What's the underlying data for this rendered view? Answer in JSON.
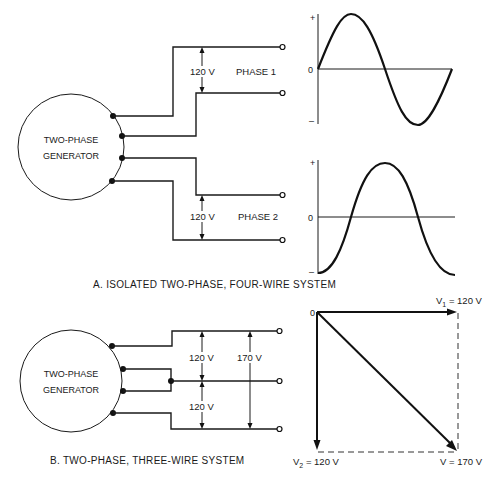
{
  "section_a": {
    "generator_label_line1": "TWO-PHASE",
    "generator_label_line2": "GENERATOR",
    "phase1_voltage": "120 V",
    "phase1_label": "PHASE 1",
    "phase2_voltage": "120 V",
    "phase2_label": "PHASE 2",
    "caption": "A.  ISOLATED TWO-PHASE, FOUR-WIRE SYSTEM",
    "waveform1": {
      "plus": "+",
      "zero": "0",
      "minus": "–",
      "type": "sine"
    },
    "waveform2": {
      "plus": "+",
      "zero": "0",
      "minus": "–",
      "type": "sine-lagging-90deg"
    }
  },
  "section_b": {
    "generator_label_line1": "TWO-PHASE",
    "generator_label_line2": "GENERATOR",
    "upper_voltage": "120 V",
    "lower_voltage": "120 V",
    "total_voltage": "170 V",
    "caption": "B.  TWO-PHASE, THREE-WIRE SYSTEM",
    "phasor": {
      "origin": "0",
      "v1_label": "V",
      "v1_sub": "1",
      "v1_value": " = 120 V",
      "v2_label": "V",
      "v2_sub": "2",
      "v2_value": " = 120 V",
      "v_result": "V = 170 V"
    }
  }
}
